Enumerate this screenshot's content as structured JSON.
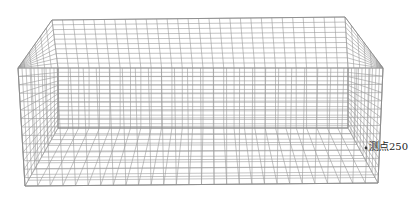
{
  "diagram": {
    "type": "3d-wireframe-mesh",
    "shape": "open rectangular box (tub) mesh",
    "colors": {
      "mesh": "#9a9a9a",
      "edge": "#8a8a8a",
      "marker": "#333333",
      "label": "#222222",
      "background": "#ffffff"
    },
    "vertices": {
      "outer_back_top_left": [
        52,
        20
      ],
      "outer_back_top_right": [
        345,
        17
      ],
      "outer_front_top_left": [
        18,
        68
      ],
      "outer_front_top_right": [
        383,
        68
      ],
      "outer_front_bottom_left": [
        25,
        186
      ],
      "outer_front_bottom_right": [
        378,
        183
      ],
      "inner_back_top_left": [
        58,
        68
      ],
      "inner_back_top_right": [
        348,
        68
      ],
      "inner_back_bottom_left": [
        58,
        128
      ],
      "inner_back_bottom_right": [
        348,
        128
      ]
    },
    "grid": {
      "top_divisions": 28,
      "depth_divisions": 10,
      "height_divisions": 14
    }
  },
  "annotation": {
    "label": "测点250",
    "marker_position": [
      366,
      148
    ]
  }
}
